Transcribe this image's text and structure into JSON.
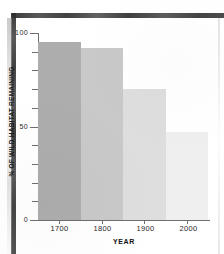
{
  "chart_data": {
    "type": "bar",
    "title": "",
    "xlabel": "YEAR",
    "ylabel": "% OF WILD HABITAT REMAINING",
    "categories": [
      "1700",
      "1800",
      "1900",
      "2000"
    ],
    "values": [
      95,
      92,
      70,
      47
    ],
    "ylim": [
      0,
      100
    ],
    "ytick_labels": [
      "0",
      "50",
      "100"
    ],
    "ytick_values": [
      0,
      50,
      100
    ],
    "minor_ytick_values": [
      10,
      20,
      30,
      40,
      60,
      70,
      80,
      90
    ],
    "grid": false,
    "legend": false,
    "bar_colors": [
      "#ADADAD",
      "#C9C9C9",
      "#DEDEDE",
      "#EFEFEF"
    ],
    "axis_color": "#6E6E6E",
    "background_color": "#FFFFFF"
  },
  "axes": {
    "y_title": "% OF WILD HABITAT REMAINING",
    "x_title": "YEAR",
    "y_labels": [
      "100",
      "50",
      "0"
    ],
    "x_labels": [
      "1700",
      "1800",
      "1900",
      "2000"
    ]
  }
}
